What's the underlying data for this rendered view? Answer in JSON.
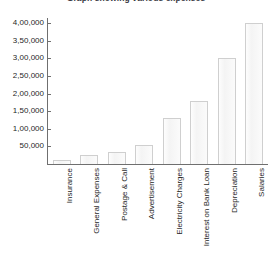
{
  "chart_data": {
    "type": "bar",
    "title": "Graph showing various expenses",
    "xlabel": "",
    "ylabel": "",
    "categories": [
      "Insurance",
      "General Expenses",
      "Postage & Call",
      "Advertisement",
      "Electricity Charges",
      "Interest on Bank Loan",
      "Depreciation",
      "Salaries"
    ],
    "values": [
      10000,
      25000,
      35000,
      55000,
      130000,
      180000,
      300000,
      400000
    ],
    "ylim": [
      0,
      400000
    ],
    "y_ticks": [
      50000,
      100000,
      150000,
      200000,
      250000,
      300000,
      350000,
      400000
    ],
    "y_tick_labels": [
      "50,000",
      "1,00,000",
      "1,50,000",
      "2,00,000",
      "2,50,000",
      "3,00,000",
      "3,50,000",
      "4,00,000"
    ],
    "grid": false,
    "legend": false,
    "bar_fill_color": "#f7f7f7",
    "bar_border_color": "#cfcfcf",
    "axis_color": "#6f6f6f",
    "text_color": "#1f1f1f"
  }
}
